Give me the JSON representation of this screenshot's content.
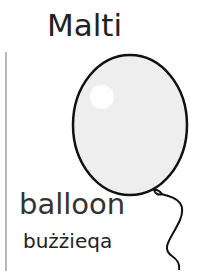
{
  "card": {
    "language": "Malti",
    "word_english": "balloon",
    "word_maltese": "bużżieqa",
    "image": "balloon-illustration"
  }
}
